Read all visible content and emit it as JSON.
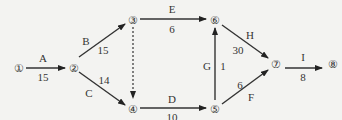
{
  "diagram": {
    "type": "activity-on-arrow network",
    "nodes": [
      {
        "id": "1",
        "label": "①",
        "x": 19,
        "y": 63
      },
      {
        "id": "2",
        "label": "②",
        "x": 74,
        "y": 63
      },
      {
        "id": "3",
        "label": "③",
        "x": 133,
        "y": 19
      },
      {
        "id": "4",
        "label": "④",
        "x": 133,
        "y": 108
      },
      {
        "id": "5",
        "label": "⑤",
        "x": 215,
        "y": 108
      },
      {
        "id": "6",
        "label": "⑥",
        "x": 215,
        "y": 19
      },
      {
        "id": "7",
        "label": "⑦",
        "x": 276,
        "y": 63
      },
      {
        "id": "8",
        "label": "⑧",
        "x": 333,
        "y": 63
      }
    ],
    "edges": [
      {
        "from": "1",
        "to": "2",
        "activity": "A",
        "duration": "15"
      },
      {
        "from": "2",
        "to": "3",
        "activity": "B",
        "duration": "15"
      },
      {
        "from": "2",
        "to": "4",
        "activity": "C",
        "duration": "14"
      },
      {
        "from": "3",
        "to": "4",
        "activity": "",
        "duration": "",
        "dummy": true
      },
      {
        "from": "3",
        "to": "6",
        "activity": "E",
        "duration": "6"
      },
      {
        "from": "4",
        "to": "5",
        "activity": "D",
        "duration": "10"
      },
      {
        "from": "5",
        "to": "6",
        "activity": "G",
        "duration": "1"
      },
      {
        "from": "5",
        "to": "7",
        "activity": "F",
        "duration": "6"
      },
      {
        "from": "6",
        "to": "7",
        "activity": "H",
        "duration": "30"
      },
      {
        "from": "7",
        "to": "8",
        "activity": "I",
        "duration": "8"
      }
    ]
  }
}
